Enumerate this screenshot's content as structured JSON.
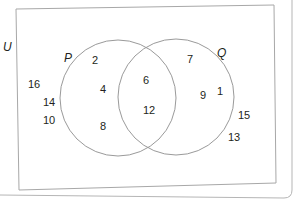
{
  "diagram": {
    "type": "venn",
    "universal_label": "U",
    "sets": [
      {
        "label": "P",
        "only": [
          "2",
          "4",
          "8"
        ]
      },
      {
        "label": "Q",
        "only": [
          "7",
          "9",
          "1"
        ]
      }
    ],
    "intersection": [
      "6",
      "12"
    ],
    "outside": [
      "16",
      "14",
      "10",
      "15",
      "13"
    ],
    "colors": {
      "line": "#9a9a9a",
      "text": "#231f20",
      "background": "#ffffff"
    }
  }
}
